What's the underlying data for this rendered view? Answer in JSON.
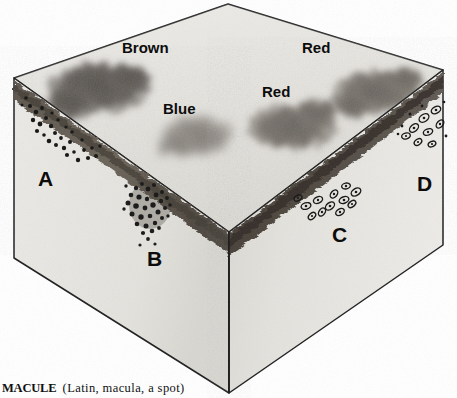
{
  "figure": {
    "caption_term": "MACULE",
    "caption_gloss": "(Latin, macula, a spot)",
    "medium": "grayscale pencil / halftone illustration",
    "width_px": 457,
    "height_px": 398
  },
  "surface_labels": [
    {
      "id": "brown",
      "text": "Brown",
      "x": 122,
      "y": 40
    },
    {
      "id": "red-right",
      "text": "Red",
      "x": 302,
      "y": 40
    },
    {
      "id": "red-center",
      "text": "Red",
      "x": 262,
      "y": 84
    },
    {
      "id": "blue",
      "text": "Blue",
      "x": 163,
      "y": 101
    }
  ],
  "zone_letters": [
    {
      "id": "a",
      "text": "A",
      "x": 38,
      "y": 168,
      "face": "left-front",
      "feature": "pigment-dots-descending-from-dermal-band"
    },
    {
      "id": "b",
      "text": "B",
      "x": 147,
      "y": 248,
      "face": "left-front",
      "feature": "dense-stippled-cell-cluster"
    },
    {
      "id": "c",
      "text": "C",
      "x": 332,
      "y": 224,
      "face": "right-front",
      "feature": "scattered-ring-cells"
    },
    {
      "id": "d",
      "text": "D",
      "x": 417,
      "y": 173,
      "face": "right-front",
      "feature": "clustered-ring-cells"
    }
  ],
  "colors": {
    "page_background": "#ffffff",
    "top_face_light": "#eceae6",
    "top_face_mid": "#dddbd6",
    "left_face": "#e9e7e3",
    "right_face": "#e3e1dc",
    "dermal_band_dark": "#4a443d",
    "dermal_band_darker": "#332e29",
    "macule_brown": "#3a3530",
    "macule_red": "#585249",
    "macule_blue": "#6e6a63",
    "outline": "#1a1a1a",
    "label_text": "#0c0c0c"
  },
  "geometry": {
    "top_apex": {
      "x": 228,
      "y": 4
    },
    "left_top_corner": {
      "x": 14,
      "y": 78
    },
    "right_top_corner": {
      "x": 443,
      "y": 70
    },
    "front_top_vertex": {
      "x": 229,
      "y": 232
    },
    "left_bottom_corner": {
      "x": 14,
      "y": 258
    },
    "right_bottom_corner": {
      "x": 443,
      "y": 245
    },
    "front_bottom_vertex": {
      "x": 229,
      "y": 393
    }
  }
}
